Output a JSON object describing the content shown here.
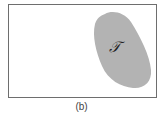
{
  "figure": {
    "caption": "(b)",
    "region_label": "𝒯",
    "colors": {
      "border": "#6e6e6e",
      "region_fill": "#b3b3b3",
      "background": "#ffffff"
    }
  }
}
